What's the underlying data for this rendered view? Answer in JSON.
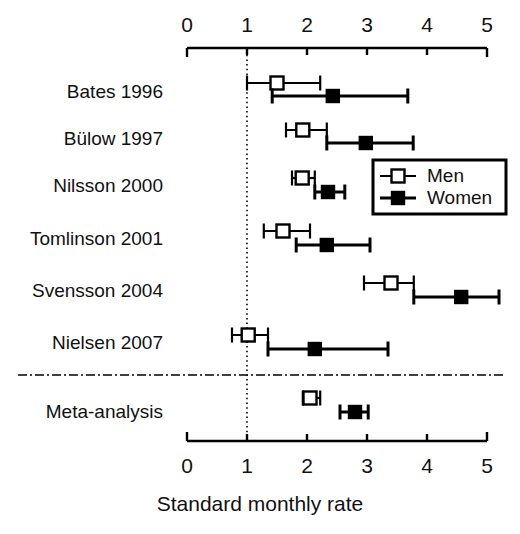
{
  "chart_data": {
    "type": "scatter",
    "subtype": "forest-plot",
    "title": "",
    "xlabel": "Standard monthly rate",
    "ylabel": "",
    "xlim": [
      0,
      5
    ],
    "xticks": [
      0,
      1,
      2,
      3,
      4,
      5
    ],
    "xtick_labels": [
      "0",
      "1",
      "2",
      "3",
      "4",
      "5"
    ],
    "axis_top": true,
    "axis_bottom": true,
    "grid": false,
    "reference_line": 1.0,
    "reference_line_style": "dotted",
    "separator_line_style": "dash-dot",
    "legend": {
      "position": "right-middle",
      "entries": [
        {
          "label": "Men",
          "marker": "open-square",
          "color": "#000000",
          "fill": "#ffffff"
        },
        {
          "label": "Women",
          "marker": "filled-square",
          "color": "#000000",
          "fill": "#000000"
        }
      ]
    },
    "categories": [
      "Bates 1996",
      "Bülow 1997",
      "Nilsson 2000",
      "Tomlinson 2001",
      "Svensson 2004",
      "Nielsen 2007",
      "Meta-analysis"
    ],
    "series": [
      {
        "name": "Men",
        "marker": "open-square",
        "points": [
          {
            "category": "Bates 1996",
            "value": 1.5,
            "ci_low": 1.0,
            "ci_high": 2.22
          },
          {
            "category": "Bülow 1997",
            "value": 1.93,
            "ci_low": 1.65,
            "ci_high": 2.33
          },
          {
            "category": "Nilsson 2000",
            "value": 1.92,
            "ci_low": 1.75,
            "ci_high": 2.13
          },
          {
            "category": "Tomlinson 2001",
            "value": 1.6,
            "ci_low": 1.28,
            "ci_high": 2.05
          },
          {
            "category": "Svensson 2004",
            "value": 3.4,
            "ci_low": 2.95,
            "ci_high": 3.78
          },
          {
            "category": "Nielsen 2007",
            "value": 1.02,
            "ci_low": 0.75,
            "ci_high": 1.35
          },
          {
            "category": "Meta-analysis",
            "value": 2.05,
            "ci_low": 1.93,
            "ci_high": 2.22
          }
        ]
      },
      {
        "name": "Women",
        "marker": "filled-square",
        "points": [
          {
            "category": "Bates 1996",
            "value": 2.43,
            "ci_low": 1.42,
            "ci_high": 3.68
          },
          {
            "category": "Bülow 1997",
            "value": 2.98,
            "ci_low": 2.33,
            "ci_high": 3.77
          },
          {
            "category": "Nilsson 2000",
            "value": 2.35,
            "ci_low": 2.13,
            "ci_high": 2.63
          },
          {
            "category": "Tomlinson 2001",
            "value": 2.33,
            "ci_low": 1.82,
            "ci_high": 3.05
          },
          {
            "category": "Svensson 2004",
            "value": 4.57,
            "ci_low": 3.78,
            "ci_high": 5.2
          },
          {
            "category": "Nielsen 2007",
            "value": 2.13,
            "ci_low": 1.35,
            "ci_high": 3.35
          },
          {
            "category": "Meta-analysis",
            "value": 2.8,
            "ci_low": 2.55,
            "ci_high": 3.02
          }
        ]
      }
    ],
    "colors": {
      "ink": "#000000",
      "paper": "#ffffff"
    }
  }
}
